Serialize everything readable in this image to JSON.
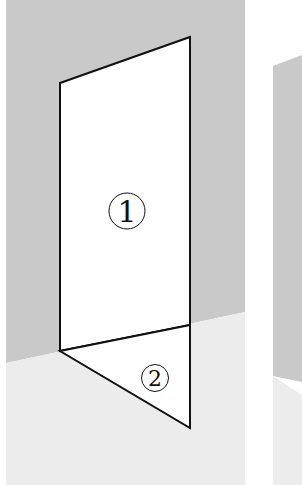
{
  "figure": {
    "colors": {
      "page_bg": "#ffffff",
      "wall": "#c9c9c9",
      "floor": "#ececec",
      "panel_fill": "#ffffff",
      "stroke": "#111111"
    },
    "regions": [
      {
        "id": 1,
        "label": "①",
        "text": "1"
      },
      {
        "id": 2,
        "label": "②",
        "text": "2"
      }
    ]
  }
}
